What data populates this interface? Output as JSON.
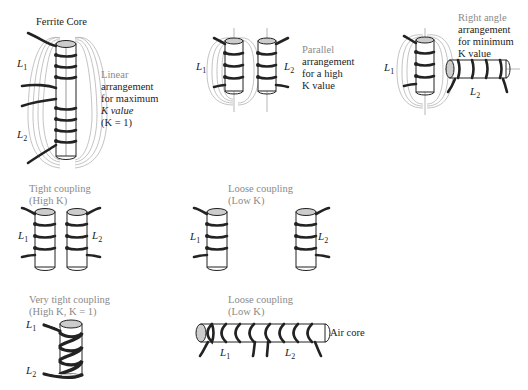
{
  "figure": {
    "panels": [
      {
        "id": "linear",
        "title": "Ferrite Core",
        "caption_lines": [
          "Linear",
          "arrangement",
          "for maximum",
          "K value",
          "(K = 1)"
        ],
        "coil_labels": [
          "L1",
          "L2"
        ]
      },
      {
        "id": "parallel",
        "caption_lines": [
          "Parallel",
          "arrangement",
          "for a high",
          "K value"
        ],
        "coil_labels": [
          "L1",
          "L2"
        ]
      },
      {
        "id": "right_angle",
        "caption_lines": [
          "Right angle",
          "arrangement",
          "for minimum",
          "K value"
        ],
        "coil_labels": [
          "L1",
          "L2"
        ]
      },
      {
        "id": "tight",
        "caption_lines": [
          "Tight coupling",
          "(High K)"
        ],
        "coil_labels": [
          "L1",
          "L2"
        ]
      },
      {
        "id": "loose",
        "caption_lines": [
          "Loose coupling",
          "(Low K)"
        ],
        "coil_labels": [
          "L1",
          "L2"
        ]
      },
      {
        "id": "very_tight",
        "caption_lines": [
          "Very tight coupling",
          "(High K, K = 1)"
        ],
        "coil_labels": [
          "L1",
          "L2"
        ]
      },
      {
        "id": "loose_air",
        "caption_lines": [
          "Loose coupling",
          "(Low K)"
        ],
        "coil_labels": [
          "L1",
          "L2"
        ],
        "core_label": "Air core"
      }
    ]
  },
  "labels": {
    "ferrite_core": "Ferrite Core",
    "air_core": "Air core",
    "L1": "L",
    "L2": "L",
    "sub1": "1",
    "sub2": "2"
  }
}
